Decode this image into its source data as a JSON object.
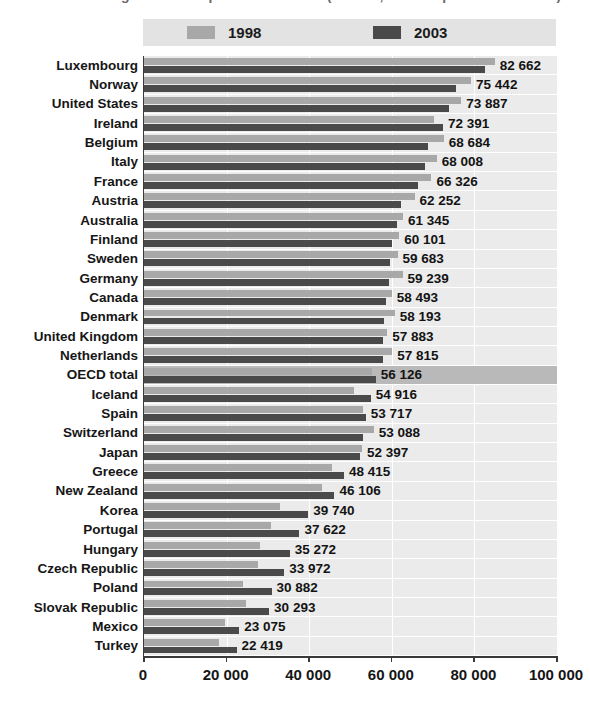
{
  "title_remnant": "Figure 1. GDP per hour worked (in USD, current prices and PPPs)",
  "legend": {
    "entries": [
      {
        "label": "1998",
        "color": "#a8a8a8",
        "swatch_name": "legend-swatch-1998"
      },
      {
        "label": "2003",
        "color": "#4a4a4a",
        "swatch_name": "legend-swatch-2003"
      }
    ]
  },
  "axis": {
    "ticks": [
      "0",
      "20 000",
      "40 000",
      "60 000",
      "80 000",
      "100 000"
    ],
    "tick_values": [
      0,
      20000,
      40000,
      60000,
      80000,
      100000
    ],
    "xmin": 0,
    "xmax": 100000
  },
  "chart_data": {
    "type": "bar",
    "orientation": "horizontal",
    "title": "",
    "xlabel": "",
    "ylabel": "",
    "xlim": [
      0,
      100000
    ],
    "grid": true,
    "legend_position": "top",
    "categories": [
      "Luxembourg",
      "Norway",
      "United States",
      "Ireland",
      "Belgium",
      "Italy",
      "France",
      "Austria",
      "Australia",
      "Finland",
      "Sweden",
      "Germany",
      "Canada",
      "Denmark",
      "United Kingdom",
      "Netherlands",
      "OECD total",
      "Iceland",
      "Spain",
      "Switzerland",
      "Japan",
      "Greece",
      "New Zealand",
      "Korea",
      "Portugal",
      "Hungary",
      "Czech Republic",
      "Poland",
      "Slovak Republic",
      "Mexico",
      "Turkey"
    ],
    "highlight_category": "OECD total",
    "value_labels": [
      "82 662",
      "75 442",
      "73 887",
      "72 391",
      "68 684",
      "68 008",
      "66 326",
      "62 252",
      "61 345",
      "60 101",
      "59 683",
      "59 239",
      "58 493",
      "58 193",
      "57 883",
      "57 815",
      "56 126",
      "54 916",
      "53 717",
      "53 088",
      "52 397",
      "48 415",
      "46 106",
      "39 740",
      "37 622",
      "35 272",
      "33 972",
      "30 882",
      "30 293",
      "23 075",
      "22 419"
    ],
    "series": [
      {
        "name": "1998",
        "color": "#a8a8a8",
        "values": [
          84900,
          79200,
          76800,
          70300,
          72600,
          70900,
          69600,
          65500,
          62700,
          61800,
          61400,
          62600,
          60000,
          60700,
          58900,
          60100,
          55200,
          50900,
          53000,
          55600,
          52800,
          45500,
          43100,
          33000,
          30800,
          28100,
          27600,
          23900,
          24700,
          19700,
          18200
        ]
      },
      {
        "name": "2003",
        "color": "#4a4a4a",
        "values": [
          82662,
          75442,
          73887,
          72391,
          68684,
          68008,
          66326,
          62252,
          61345,
          60101,
          59683,
          59239,
          58493,
          58193,
          57883,
          57815,
          56126,
          54916,
          53717,
          53088,
          52397,
          48415,
          46106,
          39740,
          37622,
          35272,
          33972,
          30882,
          30293,
          23075,
          22419
        ]
      }
    ]
  }
}
